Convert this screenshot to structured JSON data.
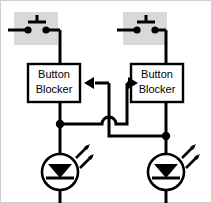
{
  "diagram": {
    "background_color": "#ffffff",
    "line_color": "#000000",
    "highlight_color": "#d9d9d9",
    "border_color": "#c8c8c8",
    "blocks": [
      {
        "id": "left-button-blocker",
        "label_line1": "Button",
        "label_line2": "Blocker",
        "x": 28,
        "y": 64,
        "width": 52,
        "height": 38
      },
      {
        "id": "right-button-blocker",
        "label_line1": "Button",
        "label_line2": "Blocker",
        "x": 131,
        "y": 64,
        "width": 52,
        "height": 38
      }
    ],
    "switches": [
      {
        "id": "left-pushbutton",
        "type": "pushbutton-normally-open",
        "highlight_x": 14,
        "highlight_y": 12,
        "highlight_width": 44,
        "highlight_height": 33
      },
      {
        "id": "right-pushbutton",
        "type": "pushbutton-normally-open",
        "highlight_x": 123,
        "highlight_y": 12,
        "highlight_width": 44,
        "highlight_height": 33
      }
    ],
    "leds": [
      {
        "id": "left-led",
        "type": "light-emitting-diode",
        "cx": 60,
        "cy": 172,
        "r": 18
      },
      {
        "id": "right-led",
        "type": "light-emitting-diode",
        "cx": 166,
        "cy": 172,
        "r": 18
      }
    ],
    "junction_dots": [
      {
        "id": "left-output-junction",
        "cx": 60,
        "cy": 124
      },
      {
        "id": "right-output-junction",
        "cx": 166,
        "cy": 136
      }
    ],
    "arrows": [
      {
        "id": "left-input-arrow",
        "direction": "left",
        "points_to": "left-button-blocker"
      },
      {
        "id": "right-input-arrow",
        "direction": "right",
        "points_to": "right-button-blocker"
      }
    ],
    "wire_hops": [
      {
        "id": "center-wire-hop",
        "cx": 109,
        "cy": 124,
        "description": "wire crossing without connection"
      }
    ]
  }
}
